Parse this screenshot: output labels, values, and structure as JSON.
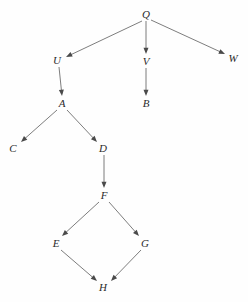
{
  "diagram": {
    "background_color": "#fefefe",
    "edge_color": "#6e6e6e",
    "arrow_color": "#4a4a4a",
    "label_color": "#2b2b2b",
    "width": 248,
    "height": 302,
    "nodes": [
      {
        "id": "Q",
        "label": "Q",
        "x": 146,
        "y": 14
      },
      {
        "id": "U",
        "label": "U",
        "x": 57,
        "y": 60
      },
      {
        "id": "V",
        "label": "V",
        "x": 146,
        "y": 61
      },
      {
        "id": "W",
        "label": "W",
        "x": 233,
        "y": 58
      },
      {
        "id": "A",
        "label": "A",
        "x": 62,
        "y": 103
      },
      {
        "id": "B",
        "label": "B",
        "x": 146,
        "y": 103
      },
      {
        "id": "C",
        "label": "C",
        "x": 13,
        "y": 148
      },
      {
        "id": "D",
        "label": "D",
        "x": 103,
        "y": 148
      },
      {
        "id": "F",
        "label": "F",
        "x": 104,
        "y": 195
      },
      {
        "id": "E",
        "label": "E",
        "x": 56,
        "y": 243
      },
      {
        "id": "G",
        "label": "G",
        "x": 145,
        "y": 243
      },
      {
        "id": "H",
        "label": "H",
        "x": 103,
        "y": 287
      }
    ],
    "edges": [
      {
        "from": "Q",
        "to": "U",
        "x1": 142,
        "y1": 21,
        "x2": 66,
        "y2": 57
      },
      {
        "from": "Q",
        "to": "V",
        "x1": 146,
        "y1": 21,
        "x2": 146,
        "y2": 54
      },
      {
        "from": "Q",
        "to": "W",
        "x1": 151,
        "y1": 20,
        "x2": 225,
        "y2": 54
      },
      {
        "from": "U",
        "to": "A",
        "x1": 59,
        "y1": 67,
        "x2": 62,
        "y2": 96
      },
      {
        "from": "A",
        "to": "C",
        "x1": 57,
        "y1": 110,
        "x2": 21,
        "y2": 142
      },
      {
        "from": "A",
        "to": "D",
        "x1": 67,
        "y1": 110,
        "x2": 97,
        "y2": 142
      },
      {
        "from": "V",
        "to": "B",
        "x1": 146,
        "y1": 68,
        "x2": 146,
        "y2": 96
      },
      {
        "from": "D",
        "to": "F",
        "x1": 104,
        "y1": 155,
        "x2": 104,
        "y2": 188
      },
      {
        "from": "F",
        "to": "E",
        "x1": 99,
        "y1": 202,
        "x2": 62,
        "y2": 236
      },
      {
        "from": "F",
        "to": "G",
        "x1": 109,
        "y1": 202,
        "x2": 139,
        "y2": 236
      },
      {
        "from": "E",
        "to": "H",
        "x1": 61,
        "y1": 250,
        "x2": 97,
        "y2": 281
      },
      {
        "from": "G",
        "to": "H",
        "x1": 141,
        "y1": 250,
        "x2": 111,
        "y2": 281
      }
    ]
  }
}
